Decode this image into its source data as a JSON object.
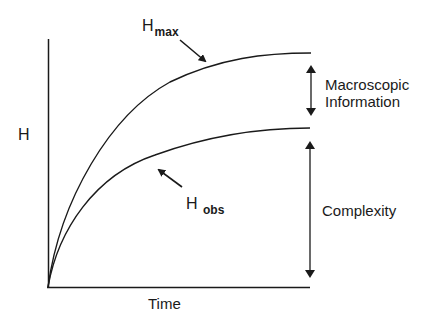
{
  "diagram": {
    "y_axis_label": "H",
    "x_axis_label": "Time",
    "curves": [
      {
        "id": "h_max",
        "base": "H",
        "subscript": "max",
        "description": "upper saturating curve"
      },
      {
        "id": "h_obs",
        "base": "H",
        "subscript": "obs",
        "description": "lower saturating curve"
      }
    ],
    "brackets": [
      {
        "id": "macroscopic_information",
        "line1": "Macroscopic",
        "line2": "Information",
        "spans": "H_max to H_obs"
      },
      {
        "id": "complexity",
        "label": "Complexity",
        "spans": "H_obs to baseline"
      }
    ],
    "stroke_color": "#1a1a1a",
    "background_color": "#ffffff"
  }
}
